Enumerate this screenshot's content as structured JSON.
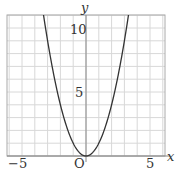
{
  "chart_data": {
    "type": "line",
    "title": "",
    "function": "y = x^2",
    "xlabel": "x",
    "ylabel": "y",
    "origin_label": "O",
    "xlim": [
      -6.2,
      6.2
    ],
    "ylim": [
      0,
      11
    ],
    "x_ticks": [
      {
        "value": -5,
        "label": "−5"
      },
      {
        "value": 5,
        "label": "5"
      }
    ],
    "y_ticks": [
      {
        "value": 5,
        "label": "5"
      },
      {
        "value": 10,
        "label": "10"
      }
    ],
    "grid": true,
    "grid_step": 1,
    "series": [
      {
        "name": "parabola",
        "x": [
          -3.3,
          -3,
          -2.5,
          -2,
          -1.5,
          -1,
          -0.5,
          0,
          0.5,
          1,
          1.5,
          2,
          2.5,
          3,
          3.3
        ],
        "values": [
          10.89,
          9,
          6.25,
          4,
          2.25,
          1,
          0.25,
          0,
          0.25,
          1,
          2.25,
          4,
          6.25,
          9,
          10.89
        ]
      }
    ],
    "colors": {
      "curve": "#333333",
      "grid": "#d8d8d8",
      "axis": "#888888"
    }
  }
}
